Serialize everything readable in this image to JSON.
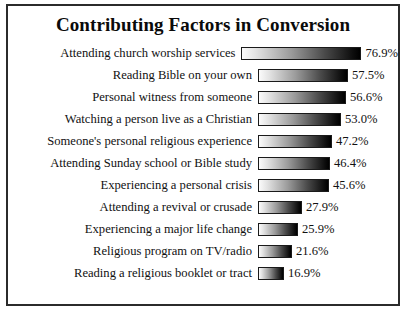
{
  "chart_data": {
    "type": "bar",
    "title": "Contributing Factors in Conversion",
    "xlabel": "",
    "ylabel": "",
    "orientation": "horizontal",
    "grid": false,
    "legend": null,
    "xlim": [
      0,
      76.9
    ],
    "value_suffix": "%",
    "categories": [
      "Attending church worship services",
      "Reading Bible on your own",
      "Personal witness from someone",
      "Watching a person live as a Christian",
      "Someone's personal religious experience",
      "Attending Sunday school or Bible study",
      "Experiencing a personal crisis",
      "Attending a revival or crusade",
      "Experiencing a major life change",
      "Religious program on TV/radio",
      "Reading a religious booklet or tract"
    ],
    "values": [
      76.9,
      57.5,
      56.6,
      53.0,
      47.2,
      46.4,
      45.6,
      27.9,
      25.9,
      21.6,
      16.9
    ],
    "value_labels": [
      "76.9%",
      "57.5%",
      "56.6%",
      "53.0%",
      "47.2%",
      "46.4%",
      "45.6%",
      "27.9%",
      "25.9%",
      "21.6%",
      "16.9%"
    ]
  },
  "style": {
    "frame_color": "#2b2b2b",
    "background": "#ffffff",
    "text_color": "#111111",
    "bar_gradient_start": "#fbfbfb",
    "bar_gradient_end": "#000000"
  }
}
